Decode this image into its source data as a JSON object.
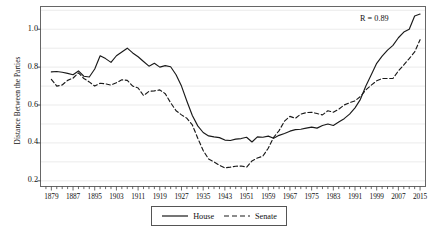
{
  "chart_data": {
    "type": "line",
    "title": "",
    "xlabel": "",
    "ylabel": "Distance Between the Parties",
    "xlim": [
      1875,
      2017
    ],
    "ylim": [
      0.17,
      1.12
    ],
    "ytick_values": [
      0.2,
      0.4,
      0.6,
      0.8,
      1.0
    ],
    "ytick_labels": [
      "0.2",
      "0.4",
      "0.6",
      "0.8",
      "1.0"
    ],
    "xtick_labels": [
      "1879",
      "1887",
      "1895",
      "1903",
      "1911",
      "1919",
      "1927",
      "1935",
      "1943",
      "1951",
      "1959",
      "1967",
      "1975",
      "1983",
      "1991",
      "1999",
      "2007",
      "2015"
    ],
    "xtick_values": [
      1879,
      1887,
      1895,
      1903,
      1911,
      1919,
      1927,
      1935,
      1943,
      1951,
      1959,
      1967,
      1975,
      1983,
      1991,
      1999,
      2007,
      2015
    ],
    "minor_tick_step": 2,
    "grid": "horizontal-minor-0.1",
    "grid_values": [
      0.2,
      0.3,
      0.4,
      0.5,
      0.6,
      0.7,
      0.8,
      0.9,
      1.0,
      1.1
    ],
    "legend_position": "below-center",
    "annotations": [
      {
        "text": "R = 0.89",
        "x": 2001,
        "y": 1.055
      }
    ],
    "x": [
      1879,
      1881,
      1883,
      1885,
      1887,
      1889,
      1891,
      1893,
      1895,
      1897,
      1899,
      1901,
      1903,
      1905,
      1907,
      1909,
      1911,
      1913,
      1915,
      1917,
      1919,
      1921,
      1923,
      1925,
      1927,
      1929,
      1931,
      1933,
      1935,
      1937,
      1939,
      1941,
      1943,
      1945,
      1947,
      1949,
      1951,
      1953,
      1955,
      1957,
      1959,
      1961,
      1963,
      1965,
      1967,
      1969,
      1971,
      1973,
      1975,
      1977,
      1979,
      1981,
      1983,
      1985,
      1987,
      1989,
      1991,
      1993,
      1995,
      1997,
      1999,
      2001,
      2003,
      2005,
      2007,
      2009,
      2011,
      2013,
      2015
    ],
    "series": [
      {
        "name": "House",
        "style": "solid",
        "color": "#1a1a1a",
        "values": [
          0.775,
          0.777,
          0.773,
          0.767,
          0.76,
          0.78,
          0.752,
          0.748,
          0.79,
          0.86,
          0.845,
          0.825,
          0.86,
          0.88,
          0.9,
          0.875,
          0.855,
          0.83,
          0.805,
          0.82,
          0.8,
          0.808,
          0.802,
          0.76,
          0.7,
          0.62,
          0.545,
          0.49,
          0.455,
          0.437,
          0.432,
          0.428,
          0.415,
          0.413,
          0.42,
          0.423,
          0.43,
          0.405,
          0.432,
          0.43,
          0.436,
          0.425,
          0.44,
          0.45,
          0.462,
          0.47,
          0.472,
          0.478,
          0.483,
          0.478,
          0.492,
          0.5,
          0.492,
          0.51,
          0.528,
          0.552,
          0.585,
          0.63,
          0.7,
          0.76,
          0.82,
          0.858,
          0.89,
          0.915,
          0.955,
          0.985,
          1.0,
          1.07,
          1.08
        ]
      },
      {
        "name": "Senate",
        "style": "dashed",
        "color": "#1a1a1a",
        "values": [
          0.735,
          0.7,
          0.706,
          0.73,
          0.742,
          0.77,
          0.74,
          0.722,
          0.7,
          0.715,
          0.712,
          0.705,
          0.718,
          0.733,
          0.73,
          0.7,
          0.69,
          0.65,
          0.672,
          0.675,
          0.68,
          0.66,
          0.612,
          0.57,
          0.548,
          0.53,
          0.495,
          0.425,
          0.36,
          0.315,
          0.3,
          0.282,
          0.268,
          0.272,
          0.277,
          0.278,
          0.272,
          0.305,
          0.32,
          0.33,
          0.372,
          0.43,
          0.465,
          0.515,
          0.54,
          0.53,
          0.552,
          0.56,
          0.562,
          0.555,
          0.548,
          0.57,
          0.562,
          0.578,
          0.6,
          0.612,
          0.622,
          0.645,
          0.68,
          0.705,
          0.728,
          0.74,
          0.74,
          0.74,
          0.78,
          0.812,
          0.845,
          0.88,
          0.945
        ]
      }
    ]
  },
  "legend": {
    "items": [
      {
        "label": "House",
        "style": "solid"
      },
      {
        "label": "Senate",
        "style": "dashed"
      }
    ]
  }
}
